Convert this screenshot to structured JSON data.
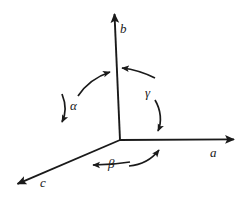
{
  "figure": {
    "name": "crystallographic-axes-angles-diagram",
    "type": "vector-diagram",
    "background_color": "#ffffff",
    "stroke_color": "#1a1a1a",
    "axes": [
      {
        "id": "a",
        "label": "a",
        "direction": "right",
        "origin": [
          120,
          140
        ],
        "tip": [
          240,
          139
        ],
        "arrowhead": true
      },
      {
        "id": "b",
        "label": "b",
        "direction": "up",
        "origin": [
          120,
          140
        ],
        "tip": [
          114,
          9
        ],
        "arrowhead": true
      },
      {
        "id": "c",
        "label": "c",
        "direction": "down-left",
        "origin": [
          120,
          140
        ],
        "tip": [
          12,
          186
        ],
        "arrowhead": true
      }
    ],
    "angles": [
      {
        "id": "alpha",
        "label": "α",
        "between": [
          "b",
          "c"
        ],
        "arrow_style": "double-headed-arc",
        "label_position": [
          74,
          105
        ]
      },
      {
        "id": "beta",
        "label": "β",
        "between": [
          "a",
          "c"
        ],
        "arrow_style": "double-headed-arc",
        "label_position": [
          113,
          163
        ]
      },
      {
        "id": "gamma",
        "label": "γ",
        "between": [
          "a",
          "b"
        ],
        "arrow_style": "double-headed-arc",
        "label_position": [
          149,
          92
        ]
      }
    ]
  }
}
